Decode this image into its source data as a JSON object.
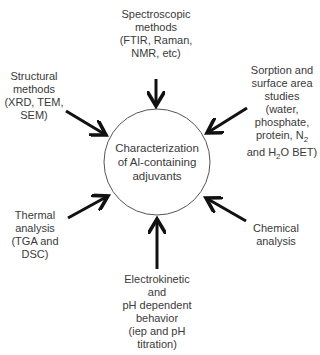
{
  "center": {
    "lines": [
      "Characterization",
      "of Al-containing",
      "adjuvants"
    ]
  },
  "nodes": {
    "spectroscopic": {
      "lines": [
        "Spectroscopic",
        "methods",
        "(FTIR, Raman,",
        "NMR, etc)"
      ]
    },
    "structural": {
      "lines": [
        "Structural",
        "methods",
        "(XRD, TEM,",
        "SEM)"
      ]
    },
    "sorption": {
      "lines": [
        "Sorption and",
        "surface area",
        "studies",
        "(water,",
        "phosphate,"
      ],
      "line6_a": "protein, N",
      "line6_sub": "2",
      "line7_a": "and H",
      "line7_sub": "2",
      "line7_b": "O BET)"
    },
    "thermal": {
      "lines": [
        "Thermal",
        "analysis",
        "(TGA and",
        "DSC)"
      ]
    },
    "chemical": {
      "lines": [
        "Chemical",
        "analysis"
      ]
    },
    "electrokinetic": {
      "lines": [
        "Electrokinetic",
        "and",
        "pH dependent",
        "behavior",
        "(iep and pH",
        "titration)"
      ]
    }
  },
  "colors": {
    "arrow": "#111111",
    "circle": "#555555",
    "text": "#3a3a3a"
  }
}
